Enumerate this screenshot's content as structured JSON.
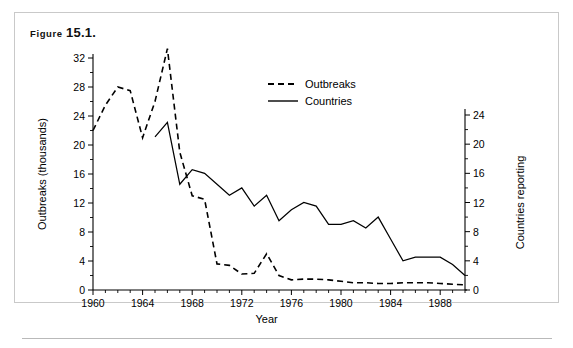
{
  "figure": {
    "label_word": "Figure",
    "number": "15.1."
  },
  "chart_data": {
    "type": "line",
    "title": "",
    "xlabel": "Year",
    "ylabel": "Outbreaks (thousands)",
    "y2label": "Countries reporting",
    "xlim": [
      1960,
      1990
    ],
    "ylim": [
      0,
      34
    ],
    "y2lim": [
      0,
      24
    ],
    "grid": false,
    "legend_position": "upper-center-right",
    "x_major_ticks": [
      1960,
      1964,
      1968,
      1972,
      1976,
      1980,
      1984,
      1988
    ],
    "x_major_labels": [
      "1960",
      "1964",
      "1968",
      "1972",
      "1976",
      "1980",
      "1984",
      "1988"
    ],
    "y_ticks": [
      0,
      4,
      8,
      12,
      16,
      20,
      24,
      28,
      32
    ],
    "y_labels": [
      "0",
      "4",
      "8",
      "12",
      "16",
      "20",
      "24",
      "28",
      "32"
    ],
    "y2_ticks": [
      0,
      4,
      8,
      12,
      16,
      20,
      24
    ],
    "y2_labels": [
      "0",
      "4",
      "8",
      "12",
      "16",
      "20",
      "24"
    ],
    "series": [
      {
        "name": "Outbreaks",
        "axis": "left",
        "style": "dashed",
        "x": [
          1960,
          1961,
          1962,
          1963,
          1964,
          1965,
          1966,
          1967,
          1968,
          1969,
          1970,
          1971,
          1972,
          1973,
          1974,
          1975,
          1976,
          1977,
          1978,
          1979,
          1980,
          1981,
          1982,
          1983,
          1984,
          1985,
          1986,
          1987,
          1988,
          1989,
          1990
        ],
        "values": [
          22.0,
          25.5,
          28.0,
          27.5,
          21.0,
          26.0,
          33.3,
          19.0,
          13.0,
          12.5,
          3.6,
          3.4,
          2.2,
          2.3,
          5.0,
          2.0,
          1.4,
          1.5,
          1.5,
          1.4,
          1.2,
          1.0,
          1.0,
          0.9,
          0.9,
          1.0,
          1.0,
          1.0,
          0.9,
          0.8,
          0.7
        ]
      },
      {
        "name": "Countries",
        "axis": "right",
        "style": "solid",
        "x": [
          1965,
          1966,
          1967,
          1968,
          1969,
          1970,
          1971,
          1972,
          1973,
          1974,
          1975,
          1976,
          1977,
          1978,
          1979,
          1980,
          1981,
          1982,
          1983,
          1984,
          1985,
          1986,
          1987,
          1988,
          1989,
          1990
        ],
        "values": [
          21.0,
          23.0,
          14.5,
          16.5,
          16.0,
          14.5,
          13.0,
          14.0,
          11.5,
          13.0,
          9.5,
          11.0,
          12.0,
          11.5,
          9.0,
          9.0,
          9.5,
          8.5,
          10.0,
          7.0,
          4.0,
          4.5,
          4.5,
          4.5,
          3.5,
          2.0
        ]
      }
    ],
    "legend": [
      {
        "label": "Outbreaks",
        "style": "dashed"
      },
      {
        "label": "Countries",
        "style": "solid"
      }
    ]
  }
}
